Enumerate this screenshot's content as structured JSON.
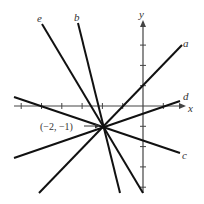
{
  "diagram": {
    "title": "",
    "axes": {
      "x_label": "x",
      "y_label": "y",
      "tick_spacing_px": 20.3,
      "origin_px": [
        143,
        106
      ]
    },
    "point": {
      "label": "(−2, −1)",
      "coords": [
        -2,
        -1
      ]
    },
    "lines": [
      {
        "id": "a",
        "label": "a",
        "from": [
          39,
          193
        ],
        "to": [
          182,
          45
        ]
      },
      {
        "id": "b",
        "label": "b",
        "from": [
          78,
          23
        ],
        "to": [
          120,
          193
        ]
      },
      {
        "id": "c",
        "label": "c",
        "from": [
          14,
          97
        ],
        "to": [
          180,
          153
        ]
      },
      {
        "id": "d",
        "label": "d",
        "from": [
          14,
          158
        ],
        "to": [
          180,
          101
        ]
      },
      {
        "id": "e",
        "label": "e",
        "from": [
          42,
          24
        ],
        "to": [
          143,
          193
        ]
      }
    ],
    "colors": {
      "line": "#111111",
      "axis": "#444444",
      "text": "#333333"
    }
  }
}
